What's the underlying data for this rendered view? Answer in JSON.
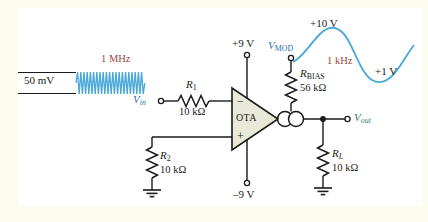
{
  "figure": {
    "type": "circuit-schematic",
    "background_outer": "#fdfdef",
    "background_inner": "#ffffff"
  },
  "colors": {
    "wire": "#1a1a1a",
    "signal_blue": "#4aa8d8",
    "label_blue": "#2d6fb0",
    "label_teal": "#2e7d6e",
    "freq_red": "#9c4a3c",
    "ota_fill": "#e8e9d8"
  },
  "input_signal": {
    "amplitude_label": "50 mV",
    "frequency_label": "1 MHz",
    "waveform": "carrier-burst",
    "color": "#4aa8d8"
  },
  "mod_signal": {
    "peak_label": "+10 V",
    "trough_label": "+1 V",
    "frequency_label": "1 kHz",
    "waveform": "sine",
    "color": "#4aa8d8"
  },
  "nodes": {
    "vin": "V",
    "vin_sub": "in",
    "vmod": "V",
    "vmod_sub": "MOD",
    "vout": "V",
    "vout_sub": "out"
  },
  "supplies": {
    "positive": "+9 V",
    "negative": "–9 V"
  },
  "amplifier": {
    "label": "OTA",
    "input_minus": "−",
    "input_plus": "+"
  },
  "components": [
    {
      "id": "R1",
      "name": "R",
      "sub": "1",
      "value": "10 kΩ"
    },
    {
      "id": "R2",
      "name": "R",
      "sub": "2",
      "value": "10 kΩ"
    },
    {
      "id": "RBIAS",
      "name": "R",
      "sub": "BIAS",
      "value": "56 kΩ"
    },
    {
      "id": "RL",
      "name": "R",
      "sub": "L",
      "value": "10 kΩ"
    }
  ]
}
